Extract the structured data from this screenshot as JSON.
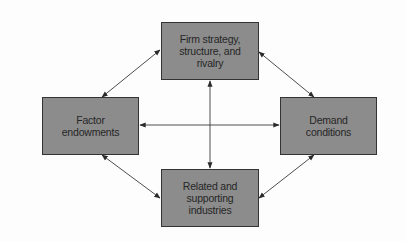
{
  "diagram": {
    "type": "porter-diamond",
    "nodes": {
      "top": {
        "label": "Firm strategy,\nstructure, and\nrivalry"
      },
      "left": {
        "label": "Factor\nendowments"
      },
      "right": {
        "label": "Demand\nconditions"
      },
      "bottom": {
        "label": "Related and\nsupporting\nindustries"
      }
    },
    "edges": [
      {
        "from": "top",
        "to": "left",
        "style": "bidirectional-arrow"
      },
      {
        "from": "top",
        "to": "right",
        "style": "bidirectional-arrow"
      },
      {
        "from": "bottom",
        "to": "left",
        "style": "bidirectional-arrow"
      },
      {
        "from": "bottom",
        "to": "right",
        "style": "bidirectional-arrow"
      },
      {
        "from": "left",
        "to": "right",
        "style": "bidirectional-arrow"
      },
      {
        "from": "top",
        "to": "bottom",
        "style": "bidirectional-arrow"
      }
    ],
    "colors": {
      "box_fill": "#8c8c8c",
      "box_border": "#333333",
      "text": "#262626",
      "line": "#3a3a3a",
      "background": "#fdfdfd"
    }
  }
}
